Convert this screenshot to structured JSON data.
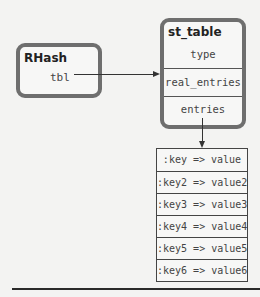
{
  "rhash": {
    "title": "RHash",
    "field": "tbl"
  },
  "st_table": {
    "title": "st_table",
    "fields": [
      "type",
      "real_entries",
      "entries"
    ]
  },
  "entries": [
    ":key => value",
    ":key2 => value2",
    ":key3 => value3",
    ":key4 => value4",
    ":key5 => value5",
    ":key6 => value6"
  ],
  "colors": {
    "box_border": "#6e6e6e",
    "line": "#333333",
    "background": "#f3f3f2"
  }
}
